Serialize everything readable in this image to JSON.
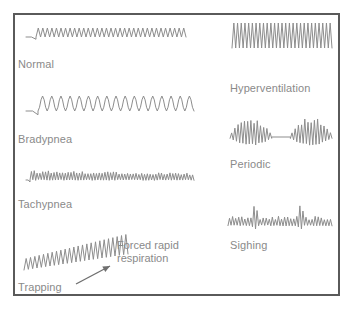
{
  "figure": {
    "border_color": "#5a5a5a",
    "trace_color": "#8d8d8d",
    "label_color": "#8a8a8a",
    "background_color": "#ffffff"
  },
  "panels": [
    {
      "id": "normal",
      "label": "Normal",
      "column": "left",
      "x": 26,
      "y": 22,
      "label_x": 18,
      "label_y": 58,
      "width": 160,
      "height": 30,
      "trace": {
        "kind": "oscillation",
        "lead_in": 10,
        "baseline": 15,
        "cycles": 33,
        "amplitude": 9,
        "amplitude_end": 9,
        "shape": "triangle",
        "description": "regular rate, regular depth"
      }
    },
    {
      "id": "bradypnea",
      "label": "Bradypnea",
      "column": "left",
      "x": 26,
      "y": 92,
      "label_x": 18,
      "label_y": 133,
      "width": 168,
      "height": 36,
      "trace": {
        "kind": "oscillation",
        "lead_in": 12,
        "baseline": 19,
        "cycles": 17,
        "amplitude": 15,
        "amplitude_end": 15,
        "shape": "round",
        "description": "slow rate, deep regular depth"
      }
    },
    {
      "id": "tachypnea",
      "label": "Tachypnea",
      "column": "left",
      "x": 26,
      "y": 166,
      "label_x": 18,
      "label_y": 198,
      "width": 168,
      "height": 26,
      "trace": {
        "kind": "oscillation",
        "lead_in": 4,
        "baseline": 14,
        "cycles": 58,
        "amplitude": 8,
        "amplitude_end": 6,
        "shape": "triangle",
        "jitter": 0.35,
        "description": "rapid rate, shallow depth"
      }
    },
    {
      "id": "trapping",
      "label": "Trapping",
      "column": "left",
      "x": 24,
      "y": 240,
      "label_x": 18,
      "label_y": 281,
      "width": 104,
      "height": 40,
      "trace": {
        "kind": "ramp-oscillation",
        "lead_in": 0,
        "baseline": 30,
        "cycles": 24,
        "amplitude": 11,
        "amplitude_end": 20,
        "baseline_rise": 16,
        "shape": "triangle",
        "description": "rapid shallow breaths with rising baseline"
      }
    },
    {
      "id": "hyperventilation",
      "label": "Hyperventilation",
      "column": "right",
      "x": 232,
      "y": 22,
      "label_x": 230,
      "label_y": 82,
      "width": 100,
      "height": 52,
      "trace": {
        "kind": "oscillation",
        "lead_in": 0,
        "baseline": 26,
        "cycles": 27,
        "amplitude": 25,
        "amplitude_end": 25,
        "shape": "triangle",
        "description": "rapid rate, very deep depth"
      }
    },
    {
      "id": "periodic",
      "label": "Periodic",
      "column": "right",
      "x": 228,
      "y": 118,
      "label_x": 230,
      "label_y": 158,
      "width": 104,
      "height": 38,
      "trace": {
        "kind": "burst-apnea",
        "baseline": 19,
        "bursts": [
          {
            "start": 0.02,
            "end": 0.42,
            "cycles": 13,
            "peak_amplitude": 17
          },
          {
            "start": 0.6,
            "end": 1.0,
            "cycles": 13,
            "peak_amplitude": 17
          }
        ],
        "apnea": {
          "start": 0.42,
          "end": 0.6
        },
        "description": "crescendo-decrescendo bursts separated by apnea"
      }
    },
    {
      "id": "sighing",
      "label": "Sighing",
      "column": "right",
      "x": 228,
      "y": 200,
      "label_x": 230,
      "label_y": 239,
      "width": 104,
      "height": 36,
      "trace": {
        "kind": "sighs",
        "baseline": 24,
        "cycles": 34,
        "amplitude": 6,
        "shape": "triangle",
        "sigh_positions": [
          0.26,
          0.7
        ],
        "sigh_amplitude": 22,
        "description": "normal shallow breaths interrupted by deep sighs"
      }
    }
  ],
  "annotations": [
    {
      "id": "forced-rapid-respiration",
      "line1": "Forced rapid",
      "line2": "respiration",
      "x": 117,
      "y": 239,
      "arrow": {
        "x1": 76,
        "y1": 284,
        "x2": 110,
        "y2": 266
      }
    }
  ]
}
